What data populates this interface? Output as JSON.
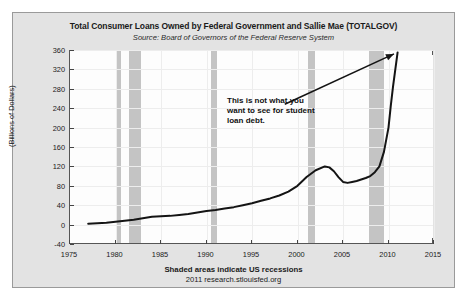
{
  "chart_data": {
    "type": "line",
    "title": "Total Consumer Loans Owned by Federal Government and Sallie Mae (TOTALGOV)",
    "subtitle": "Source: Board of Governors of the Federal Reserve System",
    "xlabel": "",
    "ylabel": "(Billions of Dollars)",
    "xlim": [
      1975,
      2015
    ],
    "ylim": [
      -40,
      360
    ],
    "yticks": [
      -40,
      0,
      40,
      80,
      120,
      160,
      200,
      240,
      280,
      320,
      360
    ],
    "xticks": [
      1975,
      1980,
      1985,
      1990,
      1995,
      2000,
      2005,
      2010,
      2015
    ],
    "grid": true,
    "legend": "none",
    "series": [
      {
        "name": "TOTALGOV",
        "x": [
          1977.0,
          1978.0,
          1979.0,
          1980.0,
          1981.0,
          1982.0,
          1983.0,
          1984.0,
          1985.0,
          1986.0,
          1987.0,
          1988.0,
          1989.0,
          1990.0,
          1991.0,
          1992.0,
          1993.0,
          1994.0,
          1995.0,
          1996.0,
          1997.0,
          1998.0,
          1999.0,
          2000.0,
          2001.0,
          2002.0,
          2003.0,
          2003.5,
          2004.0,
          2004.5,
          2005.0,
          2005.5,
          2006.0,
          2006.5,
          2007.0,
          2007.5,
          2008.0,
          2008.5,
          2009.0,
          2009.5,
          2010.0,
          2010.25,
          2010.5,
          2010.75,
          2011.0
        ],
        "y": [
          2,
          3,
          4,
          6,
          8,
          10,
          13,
          16,
          17,
          18,
          20,
          22,
          25,
          28,
          30,
          33,
          36,
          40,
          44,
          49,
          54,
          60,
          68,
          80,
          98,
          112,
          120,
          118,
          110,
          98,
          88,
          86,
          88,
          90,
          93,
          96,
          100,
          108,
          120,
          150,
          200,
          245,
          285,
          320,
          355
        ]
      }
    ],
    "recession_bands": [
      {
        "start": 1980.0,
        "end": 1980.55
      },
      {
        "start": 1981.5,
        "end": 1982.85
      },
      {
        "start": 1990.5,
        "end": 1991.2
      },
      {
        "start": 2001.2,
        "end": 2001.9
      },
      {
        "start": 2007.9,
        "end": 2009.5
      }
    ],
    "annotation": {
      "lines": [
        "This is not what you",
        "want to see for student",
        "loan debt."
      ],
      "arrow_from": [
        1998.6,
        248
      ],
      "arrow_to": [
        2010.6,
        352
      ]
    },
    "footer_note": "Shaded areas indicate US recessions",
    "footer_credit": "2011 research.stlouisfed.org",
    "colors": {
      "line": "#141414",
      "band": "#c4c4c4",
      "figure_bg": "#e3e3e3",
      "plot_bg": "#fdfdfd",
      "grid": "#ededed",
      "axis": "#555555",
      "text": "#1a1a1a"
    }
  }
}
